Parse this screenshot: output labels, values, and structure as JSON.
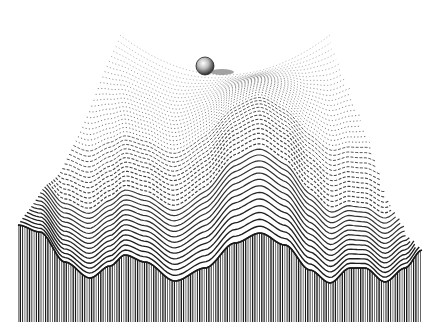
{
  "illustration": {
    "subject": "Epigenetic landscape engraving",
    "description": "A ball resting in a saddle-shaped valley at the top of a rippled, hatched surface whose front edge forms a wavy cross-section with vertical line shading.",
    "elements": [
      "ball",
      "landscape-surface",
      "front-cross-section",
      "central-hill"
    ],
    "ink_color": "#1a1a1a",
    "paper_color": "#ffffff"
  }
}
